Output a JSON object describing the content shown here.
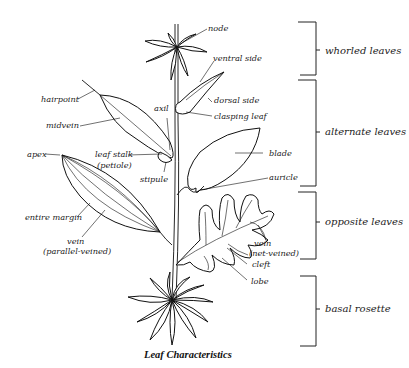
{
  "title": "Leaf Characteristics",
  "labels": {
    "node": "node",
    "ventral_side": "ventral side",
    "dorsal_side": "dorsal side",
    "clasping_leaf": "clasping leaf",
    "hairpoint": "hairpoint",
    "axil": "axil",
    "midvein": "midvein",
    "leaf_stalk": "leaf stalk",
    "petiole": "(petiole)",
    "apex": "apex",
    "stipule": "stipule",
    "blade": "blade",
    "auricle": "auricle",
    "entire_margin": "entire margin",
    "vein_parallel_1": "vein",
    "vein_parallel_2": "(parallel-veined)",
    "vein_net_1": "vein",
    "vein_net_2": "(net-veined)",
    "cleft": "cleft",
    "lobe": "lobe"
  },
  "groups": [
    {
      "label": "whorled leaves"
    },
    {
      "label": "alternate leaves"
    },
    {
      "label": "opposite leaves"
    },
    {
      "label": "basal rosette"
    }
  ]
}
